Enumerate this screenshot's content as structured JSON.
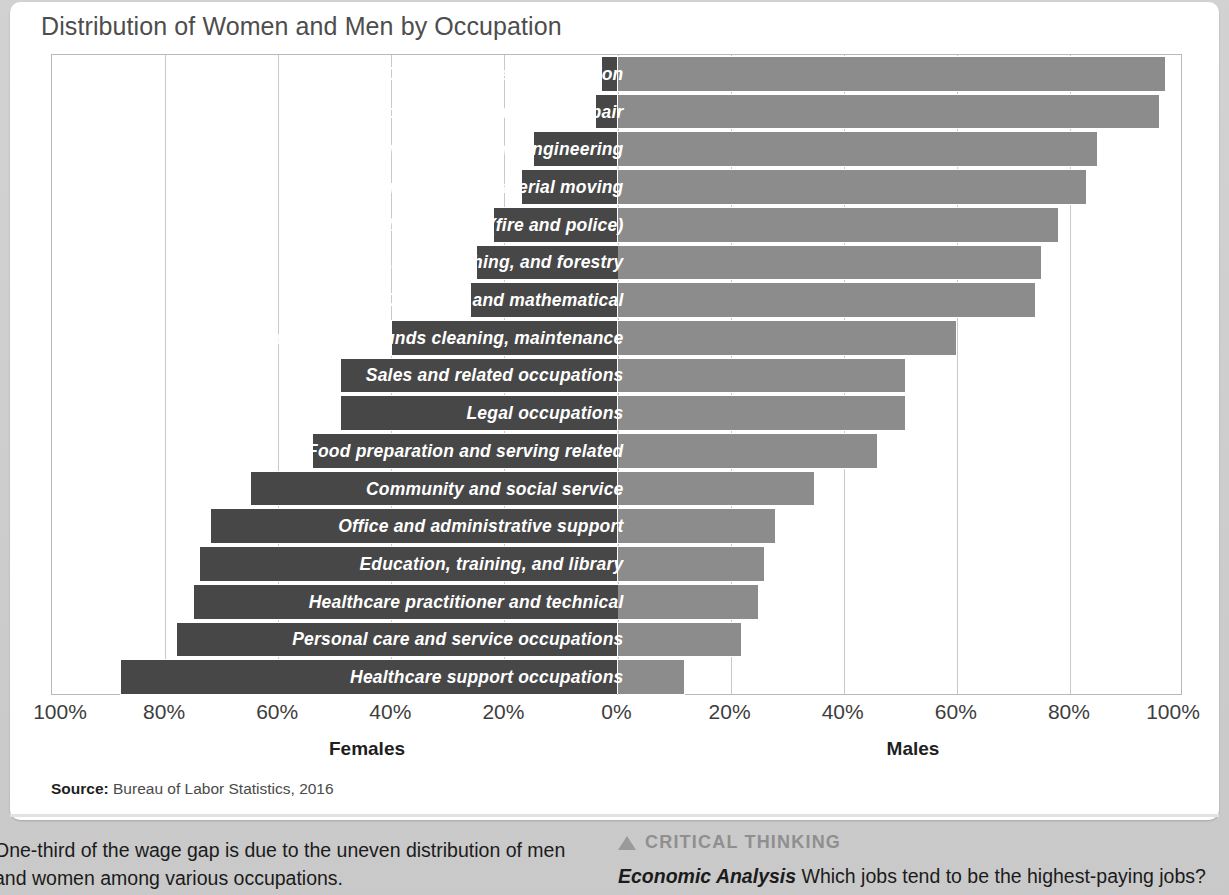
{
  "chart_title": "Distribution of Women and Men by Occupation",
  "source": {
    "label": "Source:",
    "text": "Bureau of Labor Statistics, 2016"
  },
  "axis": {
    "left_caption": "Females",
    "right_caption": "Males",
    "ticks": [
      "100%",
      "80%",
      "60%",
      "40%",
      "20%",
      "0%",
      "20%",
      "40%",
      "60%",
      "80%",
      "100%"
    ]
  },
  "colors": {
    "female_bar": "#474747",
    "male_bar": "#8c8c8c",
    "title": "#4d4d4d",
    "grid": "#c9c9c9"
  },
  "footer": {
    "left_text": "One-third of the wage gap is due to the uneven distribution of men and women among various occupations.",
    "critical_thinking_heading": "CRITICAL THINKING",
    "critical_thinking_lead": "Economic Analysis",
    "critical_thinking_text": "Which jobs tend to be the highest-paying jobs?"
  },
  "chart_data": {
    "type": "bar",
    "orientation": "horizontal",
    "style": "diverging-population-pyramid",
    "title": "Distribution of Women and Men by Occupation",
    "xlabel": "",
    "ylabel": "",
    "xlim": [
      -100,
      100
    ],
    "xtick_values": [
      -100,
      -80,
      -60,
      -40,
      -20,
      0,
      20,
      40,
      60,
      80,
      100
    ],
    "xtick_labels": [
      "100%",
      "80%",
      "60%",
      "40%",
      "20%",
      "0%",
      "20%",
      "40%",
      "60%",
      "80%",
      "100%"
    ],
    "grid": true,
    "legend": [
      "Females",
      "Males"
    ],
    "legend_position": "axis-captions",
    "categories": [
      "Construction and extraction",
      "Installation, maintenance, and repair",
      "Architecture and engineering",
      "Transportation and material moving",
      "Protective service (fire and police)",
      "Farming, fishing, and forestry",
      "Computer and mathematical",
      "Building and grounds cleaning, maintenance",
      "Sales and related occupations",
      "Legal occupations",
      "Food preparation and serving related",
      "Community and social service",
      "Office and administrative support",
      "Education, training, and library",
      "Healthcare practitioner and technical",
      "Personal care and service occupations",
      "Healthcare support occupations"
    ],
    "series": [
      {
        "name": "Females",
        "values": [
          3,
          4,
          15,
          17,
          22,
          25,
          26,
          40,
          49,
          49,
          54,
          65,
          72,
          74,
          75,
          78,
          88
        ]
      },
      {
        "name": "Males",
        "values": [
          97,
          96,
          85,
          83,
          78,
          75,
          74,
          60,
          51,
          51,
          46,
          35,
          28,
          26,
          25,
          22,
          12
        ]
      }
    ]
  }
}
